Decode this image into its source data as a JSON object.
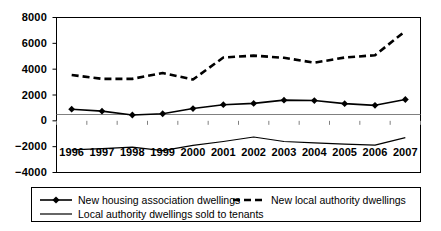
{
  "chart_data": {
    "type": "line",
    "title": "",
    "xlabel": "",
    "ylabel": "",
    "categories": [
      "1996",
      "1997",
      "1998",
      "1999",
      "2000",
      "2001",
      "2002",
      "2003",
      "2004",
      "2005",
      "2006",
      "2007"
    ],
    "ylim": [
      -4000,
      8000
    ],
    "yticks": [
      8000,
      6000,
      4000,
      2000,
      0,
      -2000,
      -4000
    ],
    "ytick_labels": [
      "8000",
      "6000",
      "4000",
      "2000",
      "0",
      "−2000",
      "−4000"
    ],
    "grid": false,
    "legend_position": "bottom",
    "series": [
      {
        "name": "New housing association dwellings",
        "style": "solid-with-diamond-markers",
        "values": [
          900,
          750,
          450,
          550,
          950,
          1250,
          1350,
          1600,
          1570,
          1330,
          1200,
          1650
        ]
      },
      {
        "name": "New local authority dwellings",
        "style": "dashed",
        "values": [
          3550,
          3250,
          3250,
          3700,
          3200,
          4900,
          5050,
          4880,
          4500,
          4900,
          5080,
          6950
        ]
      },
      {
        "name": "Local authority dwellings sold to tenants",
        "style": "solid-thin",
        "values": [
          -2250,
          -2150,
          -2030,
          -2300,
          -1900,
          -1600,
          -1250,
          -1600,
          -1700,
          -1800,
          -1880,
          -1300
        ]
      }
    ]
  },
  "legend": {
    "items": [
      {
        "label": "New housing association dwellings",
        "key": "solid-with-diamond-markers"
      },
      {
        "label": "New local authority dwellings",
        "key": "dashed"
      },
      {
        "label": "Local authority dwellings sold to tenants",
        "key": "solid-thin"
      }
    ]
  }
}
